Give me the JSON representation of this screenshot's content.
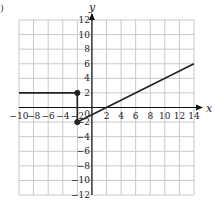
{
  "figure_label_fragment": ")",
  "chart_data": {
    "type": "line",
    "title": "",
    "xlabel": "x",
    "ylabel": "y",
    "xlim": [
      -10,
      14
    ],
    "ylim": [
      -12,
      12
    ],
    "grid": true,
    "grid_step": 2,
    "x_ticks": [
      -10,
      -8,
      -6,
      -4,
      -2,
      2,
      4,
      6,
      8,
      10,
      12,
      14
    ],
    "y_ticks": [
      12,
      10,
      8,
      6,
      4,
      2,
      -2,
      -4,
      -6,
      -8,
      -10,
      -12
    ],
    "origin_label": "0",
    "series": [
      {
        "name": "constant piece",
        "points": [
          [
            -10,
            2
          ],
          [
            -2,
            2
          ]
        ]
      },
      {
        "name": "vertical segment",
        "points": [
          [
            -2,
            2
          ],
          [
            -2,
            -2
          ]
        ]
      },
      {
        "name": "linear piece",
        "points": [
          [
            -2,
            -2
          ],
          [
            14,
            6
          ]
        ]
      }
    ],
    "markers": [
      {
        "x": -2,
        "y": 2,
        "filled": true
      },
      {
        "x": -2,
        "y": -2,
        "filled": true
      }
    ],
    "colors": {
      "grid": "#c8c8c8",
      "axis": "#111111",
      "line": "#222222"
    }
  }
}
